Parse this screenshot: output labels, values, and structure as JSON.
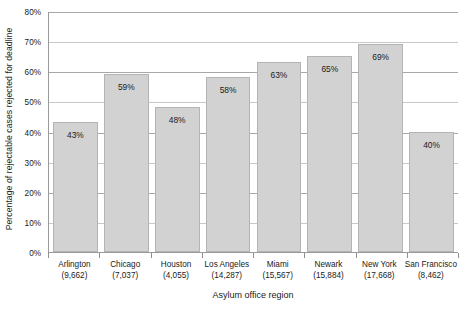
{
  "chart_data": {
    "type": "bar",
    "title": "",
    "xlabel": "Asylum office region",
    "ylabel": "Percentage of rejectable cases rejected for deadline",
    "categories": [
      "Arlington",
      "Chicago",
      "Houston",
      "Los Angeles",
      "Miami",
      "Newark",
      "New York",
      "San Francisco"
    ],
    "category_counts": [
      "(9,662)",
      "(7,037)",
      "(4,055)",
      "(14,287)",
      "(15,567)",
      "(15,884)",
      "(17,668)",
      "(8,462)"
    ],
    "values": [
      43,
      59,
      48,
      58,
      63,
      65,
      69,
      40
    ],
    "value_labels": [
      "43%",
      "59%",
      "48%",
      "58%",
      "63%",
      "65%",
      "69%",
      "40%"
    ],
    "ylim": [
      0,
      80
    ],
    "ytick_values": [
      0,
      10,
      20,
      30,
      40,
      50,
      60,
      70,
      80
    ],
    "ytick_labels": [
      "0%",
      "10%",
      "20%",
      "30%",
      "40%",
      "50%",
      "60%",
      "70%",
      "80%"
    ],
    "grid": true,
    "legend": null,
    "bar_color": "#d2d2d2",
    "bar_border_color": "#b4b4b4",
    "gridline_color": "#c8c8c8",
    "axis_color": "#9a9a9a",
    "background_color": "#ffffff",
    "text_color": "#1a1a1a"
  }
}
